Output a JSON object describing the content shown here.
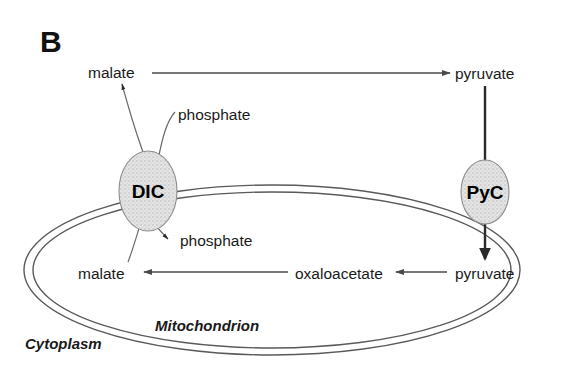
{
  "figure": {
    "panel_label": "B",
    "background_color": "#ffffff"
  },
  "compartments": [
    {
      "id": "cytoplasm",
      "label": "Cytoplasm"
    },
    {
      "id": "mitochondrion",
      "label": "Mitochondrion"
    }
  ],
  "transporters": [
    {
      "id": "dic",
      "label": "DIC",
      "fill_color": "#e0e0e0",
      "stroke_color": "#8d8d8d"
    },
    {
      "id": "pyc",
      "label": "PyC",
      "fill_color": "#e0e0e0",
      "stroke_color": "#8d8d8d"
    }
  ],
  "metabolites": {
    "malate_outer": "malate",
    "phosphate_outer": "phosphate",
    "pyruvate_outer": "pyruvate",
    "malate_inner": "malate",
    "phosphate_inner": "phosphate",
    "oxaloacetate_inner": "oxaloacetate",
    "pyruvate_inner": "pyruvate"
  },
  "colors": {
    "line": "#4a4a4a",
    "membrane": "#5a5a5a",
    "text": "#1a1a1a"
  }
}
